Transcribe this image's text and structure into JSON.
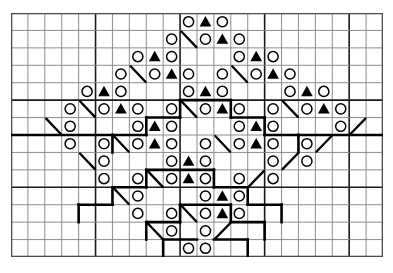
{
  "chart_data": {
    "type": "table",
    "xlabel": "stitches (columns)",
    "ylabel": "rows",
    "columns": 22,
    "rows": 14,
    "cell_px": 16.9,
    "origin": {
      "x": 11,
      "y": 13
    },
    "legend": [
      {
        "symbol": "circle",
        "glyph": "O",
        "name": "yarn-over",
        "fill": "none",
        "stroke": "#000000"
      },
      {
        "symbol": "triangle",
        "glyph": "▲",
        "name": "decrease-filled-triangle",
        "fill": "#000000"
      },
      {
        "symbol": "diagonal",
        "glyph": "\\",
        "name": "diagonal-line-stitch",
        "stroke": "#000000"
      },
      {
        "symbol": "heavy-line",
        "glyph": "—",
        "name": "pattern-outline",
        "stroke": "#000000"
      }
    ],
    "grid": {
      "minor_color": "#808080",
      "major_color": "#1a1a1a",
      "major_every_cols": 5,
      "major_every_rows": 5,
      "border_color": "#4d4d4d"
    },
    "symbols": [
      {
        "r": 1,
        "c": 10,
        "s": "circle"
      },
      {
        "r": 1,
        "c": 11,
        "s": "triangle"
      },
      {
        "r": 1,
        "c": 12,
        "s": "circle"
      },
      {
        "r": 2,
        "c": 9,
        "s": "circle"
      },
      {
        "r": 2,
        "c": 10,
        "s": "diag"
      },
      {
        "r": 2,
        "c": 11,
        "s": "circle"
      },
      {
        "r": 2,
        "c": 12,
        "s": "triangle"
      },
      {
        "r": 2,
        "c": 13,
        "s": "circle"
      },
      {
        "r": 3,
        "c": 7,
        "s": "circle"
      },
      {
        "r": 3,
        "c": 8,
        "s": "triangle"
      },
      {
        "r": 3,
        "c": 9,
        "s": "circle"
      },
      {
        "r": 3,
        "c": 13,
        "s": "circle"
      },
      {
        "r": 3,
        "c": 14,
        "s": "triangle"
      },
      {
        "r": 3,
        "c": 15,
        "s": "circle"
      },
      {
        "r": 4,
        "c": 6,
        "s": "circle"
      },
      {
        "r": 4,
        "c": 7,
        "s": "diag"
      },
      {
        "r": 4,
        "c": 8,
        "s": "circle"
      },
      {
        "r": 4,
        "c": 9,
        "s": "triangle"
      },
      {
        "r": 4,
        "c": 10,
        "s": "circle"
      },
      {
        "r": 4,
        "c": 12,
        "s": "circle"
      },
      {
        "r": 4,
        "c": 13,
        "s": "diag"
      },
      {
        "r": 4,
        "c": 14,
        "s": "circle"
      },
      {
        "r": 4,
        "c": 15,
        "s": "triangle"
      },
      {
        "r": 4,
        "c": 16,
        "s": "circle"
      },
      {
        "r": 5,
        "c": 4,
        "s": "circle"
      },
      {
        "r": 5,
        "c": 5,
        "s": "triangle"
      },
      {
        "r": 5,
        "c": 6,
        "s": "circle"
      },
      {
        "r": 5,
        "c": 10,
        "s": "circle"
      },
      {
        "r": 5,
        "c": 11,
        "s": "triangle"
      },
      {
        "r": 5,
        "c": 12,
        "s": "circle"
      },
      {
        "r": 5,
        "c": 16,
        "s": "circle"
      },
      {
        "r": 5,
        "c": 17,
        "s": "triangle"
      },
      {
        "r": 5,
        "c": 18,
        "s": "circle"
      },
      {
        "r": 6,
        "c": 3,
        "s": "circle"
      },
      {
        "r": 6,
        "c": 4,
        "s": "diag"
      },
      {
        "r": 6,
        "c": 5,
        "s": "circle"
      },
      {
        "r": 6,
        "c": 6,
        "s": "triangle"
      },
      {
        "r": 6,
        "c": 7,
        "s": "circle"
      },
      {
        "r": 6,
        "c": 9,
        "s": "circle"
      },
      {
        "r": 6,
        "c": 10,
        "s": "diag"
      },
      {
        "r": 6,
        "c": 11,
        "s": "circle"
      },
      {
        "r": 6,
        "c": 12,
        "s": "triangle"
      },
      {
        "r": 6,
        "c": 13,
        "s": "circle"
      },
      {
        "r": 6,
        "c": 15,
        "s": "circle"
      },
      {
        "r": 6,
        "c": 16,
        "s": "diag"
      },
      {
        "r": 6,
        "c": 17,
        "s": "circle"
      },
      {
        "r": 6,
        "c": 18,
        "s": "triangle"
      },
      {
        "r": 6,
        "c": 19,
        "s": "circle"
      },
      {
        "r": 7,
        "c": 2,
        "s": "diag"
      },
      {
        "r": 7,
        "c": 3,
        "s": "circle"
      },
      {
        "r": 7,
        "c": 7,
        "s": "circle"
      },
      {
        "r": 7,
        "c": 8,
        "s": "triangle"
      },
      {
        "r": 7,
        "c": 9,
        "s": "circle"
      },
      {
        "r": 7,
        "c": 13,
        "s": "circle"
      },
      {
        "r": 7,
        "c": 14,
        "s": "triangle"
      },
      {
        "r": 7,
        "c": 15,
        "s": "circle"
      },
      {
        "r": 7,
        "c": 19,
        "s": "circle"
      },
      {
        "r": 7,
        "c": 20,
        "s": "diagup"
      },
      {
        "r": 8,
        "c": 3,
        "s": "circle"
      },
      {
        "r": 8,
        "c": 5,
        "s": "circle"
      },
      {
        "r": 8,
        "c": 6,
        "s": "diag"
      },
      {
        "r": 8,
        "c": 7,
        "s": "circle"
      },
      {
        "r": 8,
        "c": 8,
        "s": "triangle"
      },
      {
        "r": 8,
        "c": 9,
        "s": "circle"
      },
      {
        "r": 8,
        "c": 11,
        "s": "circle"
      },
      {
        "r": 8,
        "c": 12,
        "s": "diag"
      },
      {
        "r": 8,
        "c": 13,
        "s": "circle"
      },
      {
        "r": 8,
        "c": 14,
        "s": "triangle"
      },
      {
        "r": 8,
        "c": 15,
        "s": "circle"
      },
      {
        "r": 8,
        "c": 17,
        "s": "circle"
      },
      {
        "r": 8,
        "c": 18,
        "s": "diagup"
      },
      {
        "r": 9,
        "c": 4,
        "s": "diag"
      },
      {
        "r": 9,
        "c": 5,
        "s": "circle"
      },
      {
        "r": 9,
        "c": 9,
        "s": "circle"
      },
      {
        "r": 9,
        "c": 10,
        "s": "triangle"
      },
      {
        "r": 9,
        "c": 11,
        "s": "circle"
      },
      {
        "r": 9,
        "c": 15,
        "s": "circle"
      },
      {
        "r": 9,
        "c": 16,
        "s": "diagup"
      },
      {
        "r": 9,
        "c": 17,
        "s": "circle"
      },
      {
        "r": 10,
        "c": 5,
        "s": "circle"
      },
      {
        "r": 10,
        "c": 7,
        "s": "circle"
      },
      {
        "r": 10,
        "c": 8,
        "s": "diag"
      },
      {
        "r": 10,
        "c": 9,
        "s": "circle"
      },
      {
        "r": 10,
        "c": 10,
        "s": "triangle"
      },
      {
        "r": 10,
        "c": 11,
        "s": "circle"
      },
      {
        "r": 10,
        "c": 13,
        "s": "circle"
      },
      {
        "r": 10,
        "c": 14,
        "s": "diagup"
      },
      {
        "r": 10,
        "c": 15,
        "s": "circle"
      },
      {
        "r": 11,
        "c": 6,
        "s": "diag"
      },
      {
        "r": 11,
        "c": 7,
        "s": "circle"
      },
      {
        "r": 11,
        "c": 11,
        "s": "circle"
      },
      {
        "r": 11,
        "c": 12,
        "s": "triangle"
      },
      {
        "r": 11,
        "c": 13,
        "s": "circle"
      },
      {
        "r": 12,
        "c": 7,
        "s": "circle"
      },
      {
        "r": 12,
        "c": 9,
        "s": "circle"
      },
      {
        "r": 12,
        "c": 10,
        "s": "diag"
      },
      {
        "r": 12,
        "c": 11,
        "s": "circle"
      },
      {
        "r": 12,
        "c": 12,
        "s": "triangle"
      },
      {
        "r": 12,
        "c": 13,
        "s": "circle"
      },
      {
        "r": 13,
        "c": 8,
        "s": "diag"
      },
      {
        "r": 13,
        "c": 9,
        "s": "circle"
      },
      {
        "r": 13,
        "c": 11,
        "s": "circle"
      },
      {
        "r": 13,
        "c": 12,
        "s": "diagup"
      },
      {
        "r": 14,
        "c": 10,
        "s": "circle"
      },
      {
        "r": 14,
        "c": 11,
        "s": "circle"
      }
    ],
    "outline_segments": [
      {
        "type": "h",
        "r": 5,
        "c0": 10,
        "c1": 13
      },
      {
        "type": "v",
        "c": 10,
        "r0": 5,
        "r1": 6
      },
      {
        "type": "v",
        "c": 13,
        "r0": 5,
        "r1": 6
      },
      {
        "type": "h",
        "r": 6,
        "c0": 8,
        "c1": 10
      },
      {
        "type": "h",
        "r": 6,
        "c0": 13,
        "c1": 15
      },
      {
        "type": "v",
        "c": 8,
        "r0": 6,
        "r1": 7
      },
      {
        "type": "v",
        "c": 15,
        "r0": 6,
        "r1": 7
      },
      {
        "type": "h",
        "r": 7,
        "c0": 6,
        "c1": 8
      },
      {
        "type": "h",
        "r": 7,
        "c0": 15,
        "c1": 17
      },
      {
        "type": "v",
        "c": 6,
        "r0": 7,
        "r1": 8
      },
      {
        "type": "v",
        "c": 17,
        "r0": 7,
        "r1": 8
      },
      {
        "type": "h",
        "r": 7,
        "c0": 0,
        "c1": 6
      },
      {
        "type": "h",
        "r": 7,
        "c0": 17,
        "c1": 22
      },
      {
        "type": "h",
        "r": 9,
        "c0": 8,
        "c1": 12
      },
      {
        "type": "v",
        "c": 8,
        "r0": 9,
        "r1": 10
      },
      {
        "type": "v",
        "c": 12,
        "r0": 9,
        "r1": 10
      },
      {
        "type": "h",
        "r": 10,
        "c0": 6,
        "c1": 8
      },
      {
        "type": "h",
        "r": 10,
        "c0": 12,
        "c1": 14
      },
      {
        "type": "v",
        "c": 6,
        "r0": 10,
        "r1": 11
      },
      {
        "type": "v",
        "c": 14,
        "r0": 10,
        "r1": 11
      },
      {
        "type": "h",
        "r": 11,
        "c0": 4,
        "c1": 6
      },
      {
        "type": "h",
        "r": 11,
        "c0": 14,
        "c1": 16
      },
      {
        "type": "v",
        "c": 4,
        "r0": 11,
        "r1": 12
      },
      {
        "type": "v",
        "c": 16,
        "r0": 11,
        "r1": 12
      },
      {
        "type": "h",
        "r": 11,
        "c0": 10,
        "c1": 13
      },
      {
        "type": "v",
        "c": 10,
        "r0": 11,
        "r1": 12
      },
      {
        "type": "v",
        "c": 13,
        "r0": 11,
        "r1": 12
      },
      {
        "type": "h",
        "r": 12,
        "c0": 8,
        "c1": 10
      },
      {
        "type": "h",
        "r": 12,
        "c0": 13,
        "c1": 15
      },
      {
        "type": "v",
        "c": 8,
        "r0": 12,
        "r1": 13
      },
      {
        "type": "v",
        "c": 15,
        "r0": 12,
        "r1": 13
      },
      {
        "type": "h",
        "r": 13,
        "c0": 9,
        "c1": 11
      },
      {
        "type": "h",
        "r": 13,
        "c0": 12,
        "c1": 14
      },
      {
        "type": "v",
        "c": 9,
        "r0": 13,
        "r1": 14
      },
      {
        "type": "v",
        "c": 14,
        "r0": 13,
        "r1": 14
      }
    ]
  }
}
